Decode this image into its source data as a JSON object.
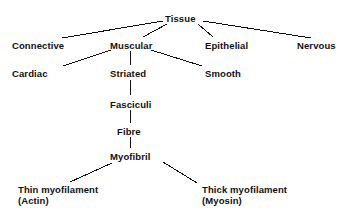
{
  "diagram": {
    "background_color": "#ffffff",
    "line_color": "#111111",
    "text_color": "#111111",
    "nodes": [
      {
        "id": "tissue",
        "label": "Tissue",
        "x": 165,
        "y": 13
      },
      {
        "id": "connective",
        "label": "Connective",
        "x": 12,
        "y": 40
      },
      {
        "id": "muscular",
        "label": "Muscular",
        "x": 110,
        "y": 40
      },
      {
        "id": "epithelial",
        "label": "Epithelial",
        "x": 205,
        "y": 40
      },
      {
        "id": "nervous",
        "label": "Nervous",
        "x": 297,
        "y": 40
      },
      {
        "id": "cardiac",
        "label": "Cardiac",
        "x": 12,
        "y": 68
      },
      {
        "id": "striated",
        "label": "Striated",
        "x": 110,
        "y": 68
      },
      {
        "id": "smooth",
        "label": "Smooth",
        "x": 205,
        "y": 68
      },
      {
        "id": "fasciculi",
        "label": "Fasciculi",
        "x": 110,
        "y": 99
      },
      {
        "id": "fibre",
        "label": "Fibre",
        "x": 117,
        "y": 126
      },
      {
        "id": "myofibril",
        "label": "Myofibril",
        "x": 110,
        "y": 151
      },
      {
        "id": "thin-myofilament",
        "label": "Thin myofilament",
        "sub": "(Actin)",
        "x": 18,
        "y": 184
      },
      {
        "id": "thick-myofilament",
        "label": "Thick myofilament",
        "sub": "(Myosin)",
        "x": 202,
        "y": 184
      }
    ],
    "edges": [
      {
        "id": "tissue-connective",
        "from": "tissue",
        "to": "connective",
        "x1": 163,
        "y1": 21,
        "x2": 62,
        "y2": 38
      },
      {
        "id": "tissue-muscular",
        "from": "tissue",
        "to": "muscular",
        "x1": 167,
        "y1": 24,
        "x2": 143,
        "y2": 37
      },
      {
        "id": "tissue-epithelial",
        "from": "tissue",
        "to": "epithelial",
        "x1": 198,
        "y1": 24,
        "x2": 213,
        "y2": 37
      },
      {
        "id": "tissue-nervous",
        "from": "tissue",
        "to": "nervous",
        "x1": 203,
        "y1": 21,
        "x2": 311,
        "y2": 38
      },
      {
        "id": "muscular-cardiac",
        "from": "muscular",
        "to": "cardiac",
        "x1": 111,
        "y1": 50,
        "x2": 63,
        "y2": 66
      },
      {
        "id": "muscular-striated",
        "from": "muscular",
        "to": "striated",
        "x1": 130,
        "y1": 51,
        "x2": 130,
        "y2": 65
      },
      {
        "id": "muscular-smooth",
        "from": "muscular",
        "to": "smooth",
        "x1": 151,
        "y1": 50,
        "x2": 202,
        "y2": 66
      },
      {
        "id": "striated-fasciculi",
        "from": "striated",
        "to": "fasciculi",
        "x1": 130,
        "y1": 80,
        "x2": 130,
        "y2": 95
      },
      {
        "id": "fasciculi-fibre",
        "from": "fasciculi",
        "to": "fibre",
        "x1": 130,
        "y1": 110,
        "x2": 130,
        "y2": 123
      },
      {
        "id": "fibre-myofibril",
        "from": "fibre",
        "to": "myofibril",
        "x1": 130,
        "y1": 137,
        "x2": 130,
        "y2": 148
      },
      {
        "id": "myofibril-thin",
        "from": "myofibril",
        "to": "thin-myofilament",
        "x1": 112,
        "y1": 163,
        "x2": 70,
        "y2": 182
      },
      {
        "id": "myofibril-thick",
        "from": "myofibril",
        "to": "thick-myofilament",
        "x1": 163,
        "y1": 162,
        "x2": 197,
        "y2": 183
      }
    ]
  }
}
